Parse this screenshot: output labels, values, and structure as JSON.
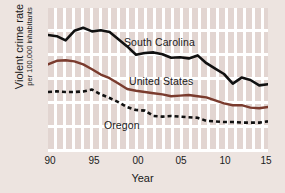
{
  "chart_data": {
    "type": "line",
    "title": "",
    "xlabel": "Year",
    "ylabel": "Violent crime rate",
    "ylabel_sub": "per 100,000 inhabitants",
    "xlim": [
      1990,
      2015
    ],
    "ylim": [
      0,
      1200
    ],
    "grid": true,
    "legend_position": "inline-labels",
    "xticks": [
      "90",
      "95",
      "00",
      "05",
      "10",
      "15"
    ],
    "xtick_values": [
      1990,
      1995,
      2000,
      2005,
      2010,
      2015
    ],
    "yticks": [],
    "x": [
      1990,
      1991,
      1992,
      1993,
      1994,
      1995,
      1996,
      1997,
      1998,
      1999,
      2000,
      2001,
      2002,
      2003,
      2004,
      2005,
      2006,
      2007,
      2008,
      2009,
      2010,
      2011,
      2012,
      2013,
      2014,
      2015
    ],
    "series": [
      {
        "name": "South Carolina",
        "color": "#111111",
        "style": "solid",
        "values": [
          975,
          965,
          930,
          1010,
          1035,
          1005,
          1015,
          1000,
          940,
          880,
          810,
          825,
          830,
          815,
          785,
          790,
          780,
          805,
          740,
          695,
          650,
          570,
          620,
          600,
          555,
          565
        ]
      },
      {
        "name": "United States",
        "color": "#7A3B2E",
        "style": "solid",
        "values": [
          730,
          760,
          765,
          755,
          730,
          690,
          645,
          615,
          570,
          525,
          510,
          500,
          490,
          480,
          465,
          470,
          475,
          465,
          455,
          430,
          405,
          390,
          390,
          370,
          365,
          375
        ]
      },
      {
        "name": "Oregon",
        "color": "#111111",
        "style": "dashed",
        "values": [
          500,
          505,
          500,
          500,
          505,
          520,
          480,
          450,
          415,
          375,
          350,
          345,
          300,
          295,
          300,
          295,
          290,
          285,
          260,
          255,
          250,
          250,
          245,
          245,
          245,
          255
        ]
      }
    ]
  },
  "axis": {
    "x_title": "Year",
    "y_title_main": "Violent crime rate",
    "y_title_sub": "per 100,000 inhabitants",
    "tick_90": "90",
    "tick_95": "95",
    "tick_00": "00",
    "tick_05": "05",
    "tick_10": "10",
    "tick_15": "15"
  },
  "labels": {
    "south_carolina": "South Carolina",
    "united_states": "United States",
    "oregon": "Oregon"
  },
  "colors": {
    "background": "#EDE4E0",
    "plot_background": "#FFFFFF",
    "stripe": "#E2D5D1",
    "south_carolina_line": "#111111",
    "united_states_line": "#7A3B2E",
    "oregon_line": "#111111"
  }
}
